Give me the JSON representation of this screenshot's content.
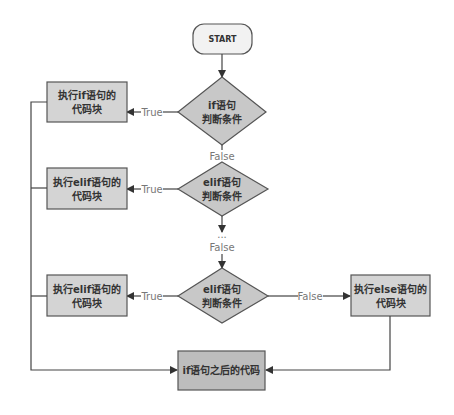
{
  "diagram": {
    "type": "flowchart",
    "colors": {
      "box_fill": "#d4d4d4",
      "final_fill": "#bdbdbd",
      "diamond_fill": "#c8c8c8",
      "start_fill": "#f2f2f2",
      "stroke": "#555555",
      "label_color": "#777777"
    },
    "nodes": {
      "start": {
        "label": "START"
      },
      "cond_if": {
        "line1": "if语句",
        "line2": "判断条件"
      },
      "cond_elif1": {
        "line1": "elif语句",
        "line2": "判断条件"
      },
      "cond_elif2": {
        "line1": "elif语句",
        "line2": "判断条件"
      },
      "block_if": {
        "line1": "执行if语句的",
        "line2": "代码块"
      },
      "block_elif1": {
        "line1": "执行elif语句的",
        "line2": "代码块"
      },
      "block_elif2": {
        "line1": "执行elif语句的",
        "line2": "代码块"
      },
      "block_else": {
        "line1": "执行else语句的",
        "line2": "代码块"
      },
      "after": {
        "label": "if语句之后的代码"
      }
    },
    "edge_labels": {
      "true1": "True",
      "true2": "True",
      "true3": "True",
      "false1": "False",
      "ellipsis": "...",
      "false2": "False",
      "false3": "False"
    }
  }
}
